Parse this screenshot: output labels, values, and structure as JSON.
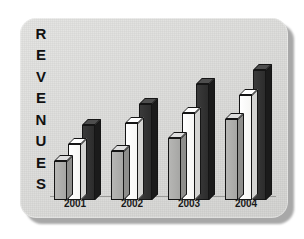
{
  "panel": {
    "background_color": "#dcdcda",
    "shadow_color": "#a8a8a8"
  },
  "axis_label": {
    "text": "REVENUES",
    "letters": [
      "R",
      "E",
      "V",
      "E",
      "N",
      "U",
      "E",
      "S"
    ],
    "orientation": "vertical-stacked"
  },
  "colors": {
    "series_gray": "#a6a6a4",
    "series_white": "#ffffff",
    "series_dark": "#2c2c2c",
    "outline": "#151515"
  },
  "chart_data": {
    "type": "bar",
    "title": "",
    "xlabel": "",
    "ylabel": "REVENUES",
    "categories": [
      "2001",
      "2002",
      "2003",
      "2004"
    ],
    "series": [
      {
        "name": "series-1",
        "color": "#a6a6a4",
        "values": [
          30,
          38,
          48,
          62
        ]
      },
      {
        "name": "series-2",
        "color": "#ffffff",
        "values": [
          43,
          59,
          67,
          81
        ]
      },
      {
        "name": "series-3",
        "color": "#2c2c2c",
        "values": [
          58,
          74,
          89,
          100
        ]
      }
    ],
    "ylim": [
      0,
      100
    ],
    "grid": false,
    "legend": "none",
    "style": "3d-isometric"
  }
}
